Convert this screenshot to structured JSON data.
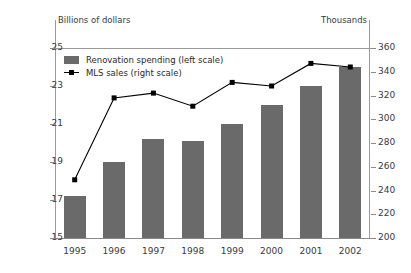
{
  "chart_data": {
    "type": "bar",
    "title": "",
    "subtitle": "",
    "xlabel": "",
    "ylabel": "Billions of dollars",
    "y2label": "Thousands",
    "categories": [
      "1995",
      "1996",
      "1997",
      "1998",
      "1999",
      "2000",
      "2001",
      "2002"
    ],
    "series": [
      {
        "name": "Renovation spending (left scale)",
        "type": "bar",
        "axis": "left",
        "color": "#6a6a6a",
        "values": [
          17.2,
          19.0,
          20.2,
          20.1,
          21.0,
          22.0,
          23.0,
          24.0
        ]
      },
      {
        "name": "MLS sales (right scale)",
        "type": "line",
        "axis": "right",
        "color": "#000000",
        "values": [
          249,
          318,
          322,
          311,
          331,
          328,
          347,
          344
        ]
      }
    ],
    "ylim": [
      15,
      25
    ],
    "yticks": [
      15,
      17,
      19,
      21,
      23,
      25
    ],
    "y2lim": [
      200,
      360
    ],
    "y2ticks": [
      200,
      220,
      240,
      260,
      280,
      300,
      320,
      340,
      360
    ],
    "grid": false,
    "legend_position": "top-left-inside"
  },
  "axes": {
    "left_unit": "Billions of dollars",
    "right_unit": "Thousands",
    "left_ticks": [
      "25",
      "23",
      "21",
      "19",
      "17",
      "15"
    ],
    "right_ticks": [
      "360",
      "340",
      "320",
      "300",
      "280",
      "260",
      "240",
      "220",
      "200"
    ],
    "x_ticks": [
      "1995",
      "1996",
      "1997",
      "1998",
      "1999",
      "2000",
      "2001",
      "2002"
    ]
  },
  "legend": {
    "items": [
      {
        "label": "Renovation spending (left scale)",
        "marker": "bar-swatch"
      },
      {
        "label": "MLS sales (right scale)",
        "marker": "line-marker"
      }
    ]
  }
}
